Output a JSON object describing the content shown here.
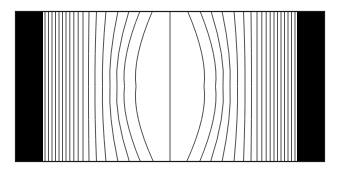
{
  "figure": {
    "background_color": "#ffffff",
    "line_color": "#3c3c3c",
    "border_color": "#1a1a1a",
    "electrode_color": "#000000",
    "frame": {
      "x": 15,
      "y": 11,
      "width": 310,
      "height": 151
    },
    "field_region": {
      "x": 43,
      "y": 11,
      "width": 254,
      "height": 151
    },
    "electrodes": [
      {
        "name": "left-electrode",
        "label": "left plate",
        "x": 15,
        "y": 11,
        "width": 28,
        "height": 151
      },
      {
        "name": "right-electrode",
        "label": "right plate",
        "x": 297,
        "y": 11,
        "width": 28,
        "height": 151
      }
    ]
  },
  "chart_data": {
    "type": "line",
    "subtitle": "",
    "xlabel": "",
    "ylabel": "",
    "xlim": [
      15,
      325
    ],
    "ylim": [
      11,
      162
    ],
    "grid": false,
    "legend": null,
    "annotations": [],
    "y_top": 11,
    "y_bottom": 162,
    "center_x": 170,
    "series": [
      {
        "name": "line-01",
        "x_top": 45.0,
        "x_mid": 45.0,
        "x_bottom": 45.0,
        "bow": 0.0
      },
      {
        "name": "line-02",
        "x_top": 48.5,
        "x_mid": 48.5,
        "x_bottom": 48.5,
        "bow": 0.0
      },
      {
        "name": "line-03",
        "x_top": 52.0,
        "x_mid": 52.0,
        "x_bottom": 52.0,
        "bow": 0.0
      },
      {
        "name": "line-04",
        "x_top": 55.5,
        "x_mid": 55.5,
        "x_bottom": 55.5,
        "bow": 0.0
      },
      {
        "name": "line-05",
        "x_top": 59.0,
        "x_mid": 59.0,
        "x_bottom": 59.0,
        "bow": 0.0
      },
      {
        "name": "line-06",
        "x_top": 62.5,
        "x_mid": 62.5,
        "x_bottom": 62.5,
        "bow": 0.0
      },
      {
        "name": "line-07",
        "x_top": 66.0,
        "x_mid": 66.0,
        "x_bottom": 66.0,
        "bow": 0.0
      },
      {
        "name": "line-08",
        "x_top": 69.8,
        "x_mid": 69.8,
        "x_bottom": 69.8,
        "bow": 0.0
      },
      {
        "name": "line-09",
        "x_top": 73.8,
        "x_mid": 73.8,
        "x_bottom": 73.8,
        "bow": 0.0
      },
      {
        "name": "line-10",
        "x_top": 78.2,
        "x_mid": 78.2,
        "x_bottom": 78.2,
        "bow": 0.0
      },
      {
        "name": "line-11",
        "x_top": 83.0,
        "x_mid": 83.0,
        "x_bottom": 83.0,
        "bow": 0.0
      },
      {
        "name": "line-12",
        "x_top": 89.0,
        "x_mid": 88.5,
        "x_bottom": 89.0,
        "bow": -0.5
      },
      {
        "name": "line-13",
        "x_top": 96.5,
        "x_mid": 95.0,
        "x_bottom": 96.5,
        "bow": -1.5
      },
      {
        "name": "line-14",
        "x_top": 106.0,
        "x_mid": 102.5,
        "x_bottom": 106.0,
        "bow": -3.5
      },
      {
        "name": "line-15",
        "x_top": 118.0,
        "x_mid": 110.0,
        "x_bottom": 118.0,
        "bow": -8.0
      },
      {
        "name": "line-16",
        "x_top": 129.0,
        "x_mid": 117.0,
        "x_bottom": 129.5,
        "bow": -12.0
      },
      {
        "name": "line-17",
        "x_top": 140.0,
        "x_mid": 124.5,
        "x_bottom": 140.5,
        "bow": -15.5
      },
      {
        "name": "line-18",
        "x_top": 152.5,
        "x_mid": 136.0,
        "x_bottom": 153.5,
        "bow": -16.5
      },
      {
        "name": "line-19",
        "x_top": 170.0,
        "x_mid": 170.0,
        "x_bottom": 170.0,
        "bow": 0.0
      },
      {
        "name": "line-20",
        "x_top": 187.5,
        "x_mid": 204.0,
        "x_bottom": 186.5,
        "bow": 16.5
      },
      {
        "name": "line-21",
        "x_top": 200.0,
        "x_mid": 215.5,
        "x_bottom": 199.5,
        "bow": 15.5
      },
      {
        "name": "line-22",
        "x_top": 211.0,
        "x_mid": 223.0,
        "x_bottom": 210.5,
        "bow": 12.0
      },
      {
        "name": "line-23",
        "x_top": 222.0,
        "x_mid": 230.0,
        "x_bottom": 222.0,
        "bow": 8.0
      },
      {
        "name": "line-24",
        "x_top": 234.0,
        "x_mid": 237.5,
        "x_bottom": 234.0,
        "bow": 3.5
      },
      {
        "name": "line-25",
        "x_top": 243.5,
        "x_mid": 245.0,
        "x_bottom": 243.5,
        "bow": 1.5
      },
      {
        "name": "line-26",
        "x_top": 251.0,
        "x_mid": 251.5,
        "x_bottom": 251.0,
        "bow": 0.5
      },
      {
        "name": "line-27",
        "x_top": 257.0,
        "x_mid": 257.0,
        "x_bottom": 257.0,
        "bow": 0.0
      },
      {
        "name": "line-28",
        "x_top": 261.8,
        "x_mid": 261.8,
        "x_bottom": 261.8,
        "bow": 0.0
      },
      {
        "name": "line-29",
        "x_top": 266.2,
        "x_mid": 266.2,
        "x_bottom": 266.2,
        "bow": 0.0
      },
      {
        "name": "line-30",
        "x_top": 270.2,
        "x_mid": 270.2,
        "x_bottom": 270.2,
        "bow": 0.0
      },
      {
        "name": "line-31",
        "x_top": 274.0,
        "x_mid": 274.0,
        "x_bottom": 274.0,
        "bow": 0.0
      },
      {
        "name": "line-32",
        "x_top": 277.5,
        "x_mid": 277.5,
        "x_bottom": 277.5,
        "bow": 0.0
      },
      {
        "name": "line-33",
        "x_top": 281.0,
        "x_mid": 281.0,
        "x_bottom": 281.0,
        "bow": 0.0
      },
      {
        "name": "line-34",
        "x_top": 284.5,
        "x_mid": 284.5,
        "x_bottom": 284.5,
        "bow": 0.0
      },
      {
        "name": "line-35",
        "x_top": 288.0,
        "x_mid": 288.0,
        "x_bottom": 288.0,
        "bow": 0.0
      },
      {
        "name": "line-36",
        "x_top": 291.5,
        "x_mid": 291.5,
        "x_bottom": 291.5,
        "bow": 0.0
      },
      {
        "name": "line-37",
        "x_top": 295.0,
        "x_mid": 295.0,
        "x_bottom": 295.0,
        "bow": 0.0
      }
    ]
  }
}
